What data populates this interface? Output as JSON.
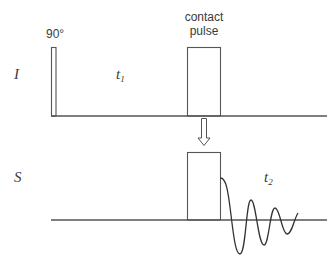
{
  "diagram": {
    "channels": [
      {
        "name": "I",
        "label": "I",
        "time_label": "t",
        "time_sub": "1"
      },
      {
        "name": "S",
        "label": "S",
        "time_label": "t",
        "time_sub": "2"
      }
    ],
    "pulses": {
      "excitation": {
        "label": "90°"
      },
      "contact": {
        "label_line1": "contact",
        "label_line2": "pulse"
      }
    },
    "arrow": {
      "direction": "down",
      "meaning": "polarization transfer I to S"
    },
    "signal": {
      "type": "FID",
      "description": "decaying oscillation on S channel"
    },
    "colors": {
      "line": "#555555",
      "text": "#3a3a3a",
      "background": "#ffffff"
    }
  }
}
